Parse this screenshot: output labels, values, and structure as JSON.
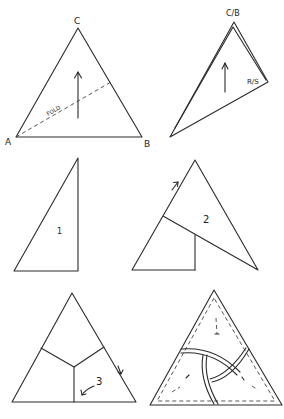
{
  "diagram": {
    "type": "origami-folding-steps",
    "panels": [
      {
        "id": "start",
        "vertex_labels": [
          "A",
          "B",
          "C"
        ],
        "fold_label": "FOLD",
        "arrow": "up"
      },
      {
        "id": "folded",
        "vertex_labels": [
          "C/B",
          "R/S"
        ],
        "arrow": "up"
      },
      {
        "id": "step1",
        "step_label": "1"
      },
      {
        "id": "step2",
        "step_label": "2",
        "arrow": "up-right"
      },
      {
        "id": "step3",
        "step_label": "3",
        "arrows": [
          "down",
          "down-left"
        ]
      },
      {
        "id": "finished",
        "description": "woven triangle with dashed edges"
      }
    ]
  },
  "labels": {
    "A": "A",
    "B": "B",
    "C": "C",
    "fold": "FOLD",
    "CB": "C/B",
    "RS": "R/S",
    "s1": "1",
    "s2": "2",
    "s3": "3"
  },
  "colors": {
    "ink": "#2a2a2a",
    "background": "#ffffff"
  }
}
